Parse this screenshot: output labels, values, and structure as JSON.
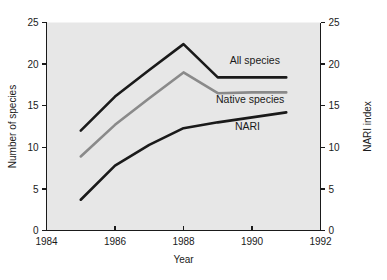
{
  "chart_data": {
    "type": "line",
    "title": "",
    "xlabel": "Year",
    "ylabel": "Number of species",
    "y2label": "NARI index",
    "xlim": [
      1984,
      1992
    ],
    "ylim": [
      0,
      25
    ],
    "y2lim": [
      0,
      25
    ],
    "xticks": [
      1984,
      1986,
      1988,
      1990,
      1992
    ],
    "xticklabels": [
      "1984",
      "1986",
      "1988",
      "1990",
      "1992"
    ],
    "yticks": [
      0,
      5,
      10,
      15,
      20,
      25
    ],
    "yticklabels": [
      "0",
      "5",
      "10",
      "15",
      "20",
      "25"
    ],
    "y2ticks": [
      0,
      5,
      10,
      15,
      20,
      25
    ],
    "y2ticklabels": [
      "0",
      "5",
      "10",
      "15",
      "20",
      "25"
    ],
    "grid": false,
    "legend_position": "inline-right-of-lines",
    "plot_background": "#e7e7e7",
    "series": [
      {
        "name": "All species",
        "axis": "left",
        "color": "#1a1a1a",
        "width": 2.6,
        "label_x": 1989.35,
        "label_y": 20.0,
        "x": [
          1985,
          1986,
          1987,
          1988,
          1989,
          1990,
          1991
        ],
        "values": [
          12.0,
          16.1,
          19.3,
          22.4,
          18.4,
          18.4,
          18.4
        ]
      },
      {
        "name": "Native species",
        "axis": "left",
        "color": "#8a8a8a",
        "width": 2.6,
        "label_x": 1988.95,
        "label_y": 15.3,
        "x": [
          1985,
          1986,
          1987,
          1988,
          1989,
          1990,
          1991
        ],
        "values": [
          8.9,
          12.7,
          15.9,
          19.0,
          16.5,
          16.6,
          16.6
        ]
      },
      {
        "name": "NARI",
        "axis": "right",
        "color": "#1a1a1a",
        "width": 2.6,
        "label_x": 1989.5,
        "label_y": 12.1,
        "x": [
          1985,
          1986,
          1987,
          1988,
          1989,
          1990,
          1991
        ],
        "values": [
          3.7,
          7.8,
          10.3,
          12.3,
          13.0,
          13.6,
          14.2
        ]
      }
    ]
  }
}
